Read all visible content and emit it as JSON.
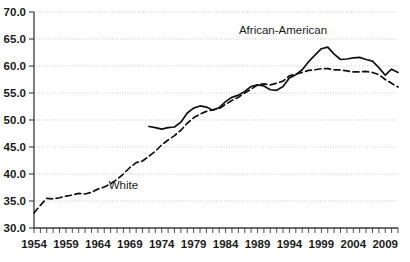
{
  "chart_data": {
    "type": "line",
    "title": "",
    "subtitle": "",
    "xlabel": "",
    "ylabel": "",
    "xlim": [
      1954,
      2011
    ],
    "ylim": [
      30.0,
      70.0
    ],
    "grid": true,
    "legend_position": "inline-annotation",
    "y_ticks": [
      "30.0",
      "35.0",
      "40.0",
      "45.0",
      "50.0",
      "55.0",
      "60.0",
      "65.0",
      "70.0"
    ],
    "y_tick_values": [
      30.0,
      35.0,
      40.0,
      45.0,
      50.0,
      55.0,
      60.0,
      65.0,
      70.0
    ],
    "x_ticks": [
      "1954",
      "1959",
      "1964",
      "1969",
      "1974",
      "1979",
      "1984",
      "1989",
      "1994",
      "1999",
      "2004",
      "2009"
    ],
    "x_tick_values": [
      1954,
      1959,
      1964,
      1969,
      1974,
      1979,
      1984,
      1989,
      1994,
      1999,
      2004,
      2009
    ],
    "x_minor_tick_step": 1,
    "annotations": [
      {
        "text": "African-American",
        "x": 1993,
        "y": 66.0
      },
      {
        "text": "White",
        "x": 1968,
        "y": 37.2
      }
    ],
    "series": [
      {
        "name": "African-American",
        "style": "solid",
        "color": "#111111",
        "x": [
          1972,
          1973,
          1974,
          1975,
          1976,
          1977,
          1978,
          1979,
          1980,
          1981,
          1982,
          1983,
          1984,
          1985,
          1986,
          1987,
          1988,
          1989,
          1990,
          1991,
          1992,
          1993,
          1994,
          1995,
          1996,
          1997,
          1998,
          1999,
          2000,
          2001,
          2002,
          2003,
          2004,
          2005,
          2006,
          2007,
          2008,
          2009,
          2010,
          2011
        ],
        "values": [
          48.8,
          48.6,
          48.3,
          48.6,
          48.7,
          49.6,
          51.3,
          52.2,
          52.6,
          52.4,
          51.8,
          52.3,
          53.4,
          54.2,
          54.6,
          55.3,
          56.2,
          56.5,
          56.3,
          55.6,
          55.5,
          56.2,
          57.8,
          58.4,
          59.3,
          60.8,
          62.0,
          63.2,
          63.5,
          62.2,
          61.2,
          61.3,
          61.5,
          61.6,
          61.2,
          60.9,
          59.7,
          58.3,
          59.4,
          58.8
        ]
      },
      {
        "name": "White",
        "style": "dashed",
        "color": "#111111",
        "x": [
          1954,
          1955,
          1956,
          1957,
          1958,
          1959,
          1960,
          1961,
          1962,
          1963,
          1964,
          1965,
          1966,
          1967,
          1968,
          1969,
          1970,
          1971,
          1972,
          1973,
          1974,
          1975,
          1976,
          1977,
          1978,
          1979,
          1980,
          1981,
          1982,
          1983,
          1984,
          1985,
          1986,
          1987,
          1988,
          1989,
          1990,
          1991,
          1992,
          1993,
          1994,
          1995,
          1996,
          1997,
          1998,
          1999,
          2000,
          2001,
          2002,
          2003,
          2004,
          2005,
          2006,
          2007,
          2008,
          2009,
          2010,
          2011
        ],
        "values": [
          32.8,
          34.2,
          35.5,
          35.4,
          35.6,
          35.9,
          36.1,
          36.4,
          36.3,
          36.6,
          37.2,
          37.6,
          38.2,
          39.0,
          40.0,
          41.2,
          42.1,
          42.4,
          43.3,
          44.2,
          45.4,
          46.3,
          47.1,
          48.1,
          49.4,
          50.4,
          51.1,
          51.6,
          51.9,
          52.1,
          52.9,
          53.6,
          54.2,
          55.0,
          55.7,
          56.5,
          56.7,
          56.5,
          56.8,
          57.2,
          58.2,
          58.5,
          58.8,
          59.2,
          59.3,
          59.5,
          59.5,
          59.3,
          59.3,
          59.1,
          58.9,
          58.9,
          59.0,
          58.8,
          58.4,
          57.5,
          56.8,
          56.1
        ]
      }
    ]
  }
}
